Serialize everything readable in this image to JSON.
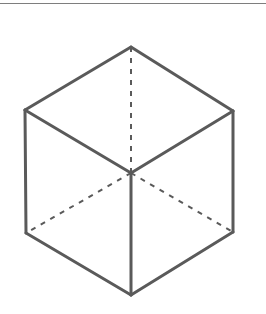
{
  "page": {
    "background_color": "#ffffff",
    "width": 266,
    "height": 314
  },
  "top_rule": {
    "color": "#7e7e7e",
    "thickness": 1,
    "y": 3
  },
  "figure": {
    "name": "wireframe-cube",
    "stroke_color": "#5a5a5a",
    "visible_stroke_width": 3,
    "hidden_stroke_width": 2,
    "hidden_dash_pattern": "5 6",
    "vertices": {
      "top": [
        131,
        47
      ],
      "upper_left": [
        25,
        110
      ],
      "upper_right": [
        233,
        111
      ],
      "center": [
        131,
        173
      ],
      "lower_left": [
        26,
        233
      ],
      "lower_right": [
        233,
        232
      ],
      "bottom": [
        131,
        295
      ]
    },
    "visible_edges": [
      {
        "name": "top-to-upper-left",
        "from": "top",
        "to": "upper_left"
      },
      {
        "name": "top-to-upper-right",
        "from": "top",
        "to": "upper_right"
      },
      {
        "name": "upper-left-to-lower-left",
        "from": "upper_left",
        "to": "lower_left"
      },
      {
        "name": "upper-right-to-lower-right",
        "from": "upper_right",
        "to": "lower_right"
      },
      {
        "name": "lower-left-to-bottom",
        "from": "lower_left",
        "to": "bottom"
      },
      {
        "name": "lower-right-to-bottom",
        "from": "lower_right",
        "to": "bottom"
      },
      {
        "name": "center-to-upper-left",
        "from": "center",
        "to": "upper_left"
      },
      {
        "name": "center-to-upper-right",
        "from": "center",
        "to": "upper_right"
      },
      {
        "name": "center-to-bottom",
        "from": "center",
        "to": "bottom"
      }
    ],
    "hidden_edges": [
      {
        "name": "center-to-top",
        "from": "center",
        "to": "top"
      },
      {
        "name": "center-to-lower-left",
        "from": "center",
        "to": "lower_left"
      },
      {
        "name": "center-to-lower-right",
        "from": "center",
        "to": "lower_right"
      }
    ]
  }
}
